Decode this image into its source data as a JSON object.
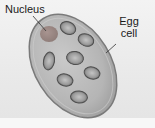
{
  "diagram": {
    "labels": {
      "nucleus": "Nucleus",
      "egg_line1": "Egg",
      "egg_line2": "cell"
    },
    "colors": {
      "background": "#ececec",
      "cell_fill": "#b9b9b9",
      "cell_outline": "#7a7a7a",
      "egg_nucleus": "#9e8a85",
      "nuclei_fill": "#a8a8a8",
      "nuclei_outline": "#555555",
      "text": "#1a1a1a"
    },
    "structures": [
      {
        "name": "egg-cell",
        "label": "Egg cell"
      },
      {
        "name": "nucleus",
        "label": "Nucleus"
      },
      {
        "name": "other-nuclei",
        "count": 7
      }
    ]
  }
}
